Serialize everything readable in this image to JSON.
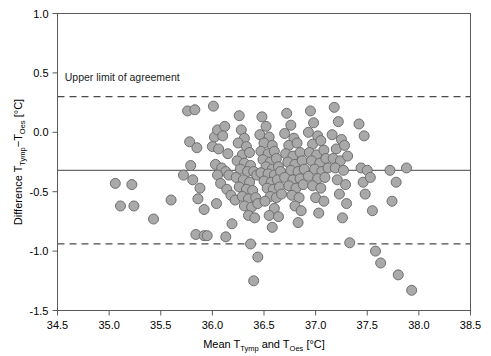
{
  "chart_data": {
    "type": "scatter",
    "title": "",
    "xlabel": "Mean T_Tymp and T_Oes [°C]",
    "ylabel": "Difference T_Tymp − T_Oes [°C]",
    "xlabel_parts": {
      "pre": "Mean T",
      "sub1": "Tymp",
      "mid": " and T",
      "sub2": "Oes",
      "post": " [°C]"
    },
    "ylabel_parts": {
      "pre": "Difference T",
      "sub1": "Tymp",
      "mid": "−T",
      "sub2": "Oes",
      "post": " [°C]"
    },
    "xlim": [
      34.5,
      38.5
    ],
    "ylim": [
      -1.5,
      1.0
    ],
    "xticks": [
      34.5,
      35.0,
      35.5,
      36.0,
      36.5,
      37.0,
      37.5,
      38.0,
      38.5
    ],
    "xtick_labels": [
      "34.5",
      "35.0",
      "35.5",
      "36.0",
      "36.5",
      "37.0",
      "37.5",
      "38.0",
      "38.5"
    ],
    "yticks": [
      1.0,
      0.5,
      0.0,
      -0.5,
      -1.0,
      -1.5
    ],
    "ytick_labels": [
      "1.0",
      "0.5",
      "0.0",
      "-0.5",
      "-1.0",
      "-1.5"
    ],
    "grid": false,
    "legend": null,
    "marker": {
      "shape": "circle",
      "size_px": 10,
      "fill": "#a9a9a9",
      "edge": "#6e6e6e"
    },
    "reference_lines": [
      {
        "name": "mean-bias",
        "style": "solid",
        "y": -0.32,
        "color": "#6a6a6a"
      },
      {
        "name": "upper-limit-of-agreement",
        "style": "dashed",
        "y": 0.3,
        "color": "#4a4a4a"
      },
      {
        "name": "lower-limit-of-agreement",
        "style": "dashed",
        "y": -0.94,
        "color": "#4a4a4a"
      }
    ],
    "annotations": [
      {
        "name": "upper-limit-of-agreement-label",
        "text": "Upper limit of agreement",
        "x": 34.57,
        "y": 0.43
      }
    ],
    "points": [
      [
        35.06,
        -0.43
      ],
      [
        35.11,
        -0.62
      ],
      [
        35.22,
        -0.44
      ],
      [
        35.24,
        -0.62
      ],
      [
        35.43,
        -0.73
      ],
      [
        35.6,
        -0.57
      ],
      [
        35.76,
        0.18
      ],
      [
        35.83,
        0.19
      ],
      [
        35.78,
        -0.08
      ],
      [
        35.85,
        -0.13
      ],
      [
        35.79,
        -0.28
      ],
      [
        35.72,
        -0.36
      ],
      [
        35.81,
        -0.4
      ],
      [
        35.88,
        -0.47
      ],
      [
        35.86,
        -0.56
      ],
      [
        35.92,
        -0.65
      ],
      [
        35.84,
        -0.86
      ],
      [
        35.92,
        -0.87
      ],
      [
        35.95,
        -0.87
      ],
      [
        36.01,
        0.22
      ],
      [
        36.02,
        -0.04
      ],
      [
        36.05,
        0.02
      ],
      [
        36.0,
        -0.12
      ],
      [
        36.06,
        -0.14
      ],
      [
        36.12,
        0.05
      ],
      [
        36.1,
        -0.03
      ],
      [
        36.15,
        -0.18
      ],
      [
        36.03,
        -0.27
      ],
      [
        36.09,
        -0.3
      ],
      [
        36.13,
        -0.33
      ],
      [
        36.05,
        -0.36
      ],
      [
        36.16,
        -0.36
      ],
      [
        36.08,
        -0.43
      ],
      [
        36.14,
        -0.48
      ],
      [
        36.18,
        -0.53
      ],
      [
        36.04,
        -0.6
      ],
      [
        36.19,
        -0.77
      ],
      [
        36.13,
        -0.88
      ],
      [
        36.22,
        -0.57
      ],
      [
        36.26,
        0.14
      ],
      [
        36.28,
        0.02
      ],
      [
        36.31,
        -0.05
      ],
      [
        36.25,
        -0.09
      ],
      [
        36.33,
        -0.12
      ],
      [
        36.29,
        -0.19
      ],
      [
        36.36,
        -0.17
      ],
      [
        36.24,
        -0.24
      ],
      [
        36.31,
        -0.26
      ],
      [
        36.37,
        -0.28
      ],
      [
        36.27,
        -0.31
      ],
      [
        36.34,
        -0.33
      ],
      [
        36.4,
        -0.33
      ],
      [
        36.23,
        -0.38
      ],
      [
        36.3,
        -0.4
      ],
      [
        36.36,
        -0.42
      ],
      [
        36.43,
        -0.36
      ],
      [
        36.26,
        -0.46
      ],
      [
        36.33,
        -0.48
      ],
      [
        36.39,
        -0.49
      ],
      [
        36.29,
        -0.54
      ],
      [
        36.35,
        -0.56
      ],
      [
        36.42,
        -0.55
      ],
      [
        36.31,
        -0.62
      ],
      [
        36.38,
        -0.63
      ],
      [
        36.44,
        -0.6
      ],
      [
        36.35,
        -0.7
      ],
      [
        36.41,
        -0.72
      ],
      [
        36.37,
        -0.94
      ],
      [
        36.44,
        -1.05
      ],
      [
        36.4,
        -1.25
      ],
      [
        36.48,
        0.13
      ],
      [
        36.52,
        0.05
      ],
      [
        36.46,
        -0.02
      ],
      [
        36.55,
        -0.04
      ],
      [
        36.5,
        -0.09
      ],
      [
        36.58,
        -0.11
      ],
      [
        36.47,
        -0.16
      ],
      [
        36.54,
        -0.18
      ],
      [
        36.6,
        -0.16
      ],
      [
        36.49,
        -0.23
      ],
      [
        36.56,
        -0.25
      ],
      [
        36.62,
        -0.22
      ],
      [
        36.52,
        -0.29
      ],
      [
        36.58,
        -0.31
      ],
      [
        36.64,
        -0.29
      ],
      [
        36.47,
        -0.34
      ],
      [
        36.54,
        -0.35
      ],
      [
        36.6,
        -0.36
      ],
      [
        36.66,
        -0.33
      ],
      [
        36.5,
        -0.41
      ],
      [
        36.57,
        -0.42
      ],
      [
        36.63,
        -0.4
      ],
      [
        36.53,
        -0.47
      ],
      [
        36.59,
        -0.48
      ],
      [
        36.65,
        -0.46
      ],
      [
        36.56,
        -0.54
      ],
      [
        36.62,
        -0.55
      ],
      [
        36.51,
        -0.58
      ],
      [
        36.67,
        -0.52
      ],
      [
        36.6,
        -0.64
      ],
      [
        36.55,
        -0.7
      ],
      [
        36.64,
        -0.71
      ],
      [
        36.58,
        -0.8
      ],
      [
        36.72,
        0.16
      ],
      [
        36.76,
        0.06
      ],
      [
        36.7,
        -0.01
      ],
      [
        36.79,
        -0.05
      ],
      [
        36.74,
        -0.11
      ],
      [
        36.82,
        -0.09
      ],
      [
        36.71,
        -0.18
      ],
      [
        36.78,
        -0.2
      ],
      [
        36.85,
        -0.17
      ],
      [
        36.73,
        -0.25
      ],
      [
        36.8,
        -0.27
      ],
      [
        36.87,
        -0.24
      ],
      [
        36.76,
        -0.32
      ],
      [
        36.83,
        -0.33
      ],
      [
        36.89,
        -0.31
      ],
      [
        36.7,
        -0.38
      ],
      [
        36.78,
        -0.4
      ],
      [
        36.85,
        -0.39
      ],
      [
        36.74,
        -0.45
      ],
      [
        36.81,
        -0.47
      ],
      [
        36.88,
        -0.44
      ],
      [
        36.77,
        -0.53
      ],
      [
        36.84,
        -0.55
      ],
      [
        36.8,
        -0.62
      ],
      [
        36.86,
        -0.66
      ],
      [
        36.83,
        -0.76
      ],
      [
        36.95,
        0.18
      ],
      [
        36.98,
        0.08
      ],
      [
        36.93,
        0.0
      ],
      [
        37.02,
        -0.03
      ],
      [
        36.97,
        -0.1
      ],
      [
        37.05,
        -0.07
      ],
      [
        36.94,
        -0.17
      ],
      [
        37.01,
        -0.19
      ],
      [
        37.08,
        -0.15
      ],
      [
        36.96,
        -0.24
      ],
      [
        37.04,
        -0.26
      ],
      [
        37.1,
        -0.22
      ],
      [
        36.99,
        -0.31
      ],
      [
        37.06,
        -0.33
      ],
      [
        37.12,
        -0.3
      ],
      [
        36.93,
        -0.37
      ],
      [
        37.02,
        -0.39
      ],
      [
        37.09,
        -0.38
      ],
      [
        36.97,
        -0.45
      ],
      [
        37.05,
        -0.47
      ],
      [
        37.0,
        -0.55
      ],
      [
        37.08,
        -0.58
      ],
      [
        37.03,
        -0.68
      ],
      [
        37.18,
        0.21
      ],
      [
        37.22,
        0.09
      ],
      [
        37.16,
        -0.02
      ],
      [
        37.25,
        -0.06
      ],
      [
        37.2,
        -0.14
      ],
      [
        37.28,
        -0.11
      ],
      [
        37.17,
        -0.22
      ],
      [
        37.24,
        -0.24
      ],
      [
        37.31,
        -0.2
      ],
      [
        37.19,
        -0.3
      ],
      [
        37.27,
        -0.32
      ],
      [
        37.21,
        -0.4
      ],
      [
        37.29,
        -0.44
      ],
      [
        37.23,
        -0.52
      ],
      [
        37.3,
        -0.6
      ],
      [
        37.26,
        -0.72
      ],
      [
        37.33,
        -0.93
      ],
      [
        37.42,
        0.07
      ],
      [
        37.47,
        -0.03
      ],
      [
        37.44,
        -0.3
      ],
      [
        37.5,
        -0.32
      ],
      [
        37.46,
        -0.42
      ],
      [
        37.53,
        -0.38
      ],
      [
        37.48,
        -0.52
      ],
      [
        37.55,
        -0.66
      ],
      [
        37.58,
        -1.0
      ],
      [
        37.63,
        -1.1
      ],
      [
        37.72,
        -0.32
      ],
      [
        37.78,
        -0.42
      ],
      [
        37.74,
        -0.58
      ],
      [
        37.8,
        -1.2
      ],
      [
        37.88,
        -0.3
      ],
      [
        37.93,
        -1.33
      ]
    ]
  }
}
